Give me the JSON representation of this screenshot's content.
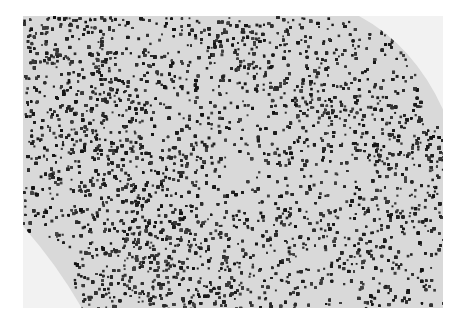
{
  "image": {
    "kind": "grayscale histology micrograph",
    "subject": "dense lymphoid tissue with darkly stained small nuclei and paler patches",
    "colors": {
      "background": "#ffffff",
      "tissue_base": "#d9d9d9",
      "nuclei": "#1e1e1e",
      "pale_region": "#e8e8e8"
    }
  }
}
